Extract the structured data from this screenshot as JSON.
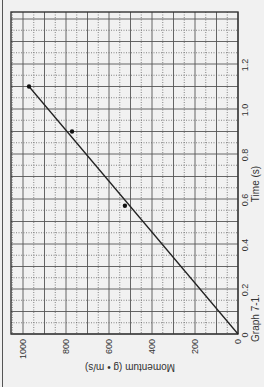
{
  "chart_data": {
    "type": "scatter",
    "title": "Graph 7-1.",
    "xlabel": "Time (s)",
    "ylabel": "Momentum (g • m/s)",
    "orientation": "rotated 90° counter-clockwise",
    "x_ticks": [
      "0",
      "0.2",
      "0.4",
      "0.6",
      "0.8",
      "1.0",
      "1.2"
    ],
    "y_ticks": [
      "0",
      "200",
      "400",
      "600",
      "800",
      "1000"
    ],
    "xlim": [
      0,
      1.43
    ],
    "ylim": [
      0,
      1056
    ],
    "grid": true,
    "series": [
      {
        "name": "measured",
        "points": [
          {
            "x": 0.57,
            "y": 526
          },
          {
            "x": 0.9,
            "y": 772
          },
          {
            "x": 1.1,
            "y": 972
          }
        ]
      }
    ],
    "fit_line": {
      "from": {
        "x": 0,
        "y": 0
      },
      "to": {
        "x": 1.1,
        "y": 972
      }
    }
  },
  "colors": {
    "background": "#f1f1f1",
    "grid": "#555555",
    "line": "#222222",
    "text": "#333333"
  }
}
